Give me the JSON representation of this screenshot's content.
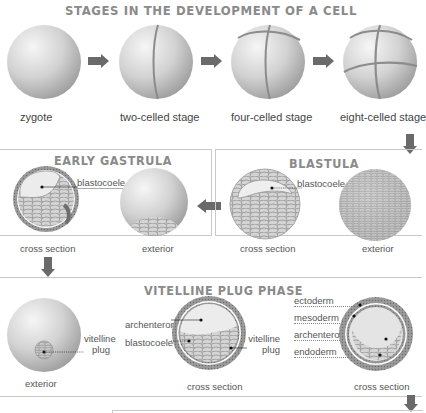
{
  "title": "STAGES IN THE DEVELOPMENT OF A CELL",
  "top_row": {
    "stages": [
      {
        "label": "zygote"
      },
      {
        "label": "two-celled stage"
      },
      {
        "label": "four-celled stage"
      },
      {
        "label": "eight-celled stage"
      }
    ]
  },
  "early_gastrula": {
    "title": "EARLY GASTRULA",
    "callout": "blastocoele",
    "captions": [
      "cross section",
      "exterior"
    ]
  },
  "blastula": {
    "title": "BLASTULA",
    "callout": "blastocoele",
    "captions": [
      "cross section",
      "exterior"
    ]
  },
  "vitelline_plug_phase": {
    "title": "VITELLINE PLUG PHASE",
    "exterior": {
      "callout": "vitelline plug",
      "callout_line1": "vitelline",
      "callout_line2": "plug",
      "caption": "exterior"
    },
    "section1": {
      "callouts": [
        "archenteron",
        "blastocoele"
      ],
      "right_callout_line1": "vitelline",
      "right_callout_line2": "plug",
      "caption": "cross section"
    },
    "section2": {
      "callouts": [
        "ectoderm",
        "mesoderm",
        "archenteron",
        "endoderm"
      ],
      "caption": "cross section"
    }
  },
  "colors": {
    "arrow": "#6a6a6a",
    "panel_border": "#c9c9c9",
    "title_gray": "#8a8a8a",
    "sphere_light": "#f2f2f2",
    "sphere_dark": "#a9a9a9",
    "cell_fill": "#d6d6d6",
    "cell_line": "#8c8c8c"
  }
}
